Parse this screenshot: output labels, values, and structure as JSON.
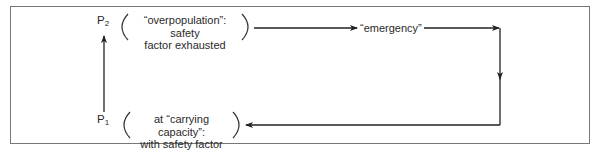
{
  "diagram": {
    "type": "cycle-flow",
    "colors": {
      "frame": "#777777",
      "line": "#222222",
      "text": "#2a2a2a",
      "background": "#ffffff"
    },
    "states": [
      {
        "id": "p2",
        "symbol": "P",
        "subscript": "2",
        "description_line1": "“overpopulation”: safety",
        "description_line2": "factor exhausted"
      },
      {
        "id": "p1",
        "symbol": "P",
        "subscript": "1",
        "description_line1": "at “carrying capacity”:",
        "description_line2": "with safety factor"
      }
    ],
    "intermediate": {
      "label": "“emergency”"
    },
    "edges": [
      {
        "from": "p1",
        "to": "p2",
        "direction": "up"
      },
      {
        "from": "p2",
        "to": "emergency",
        "direction": "right"
      },
      {
        "from": "emergency",
        "to": "p1",
        "direction": "right-down-left"
      }
    ]
  }
}
